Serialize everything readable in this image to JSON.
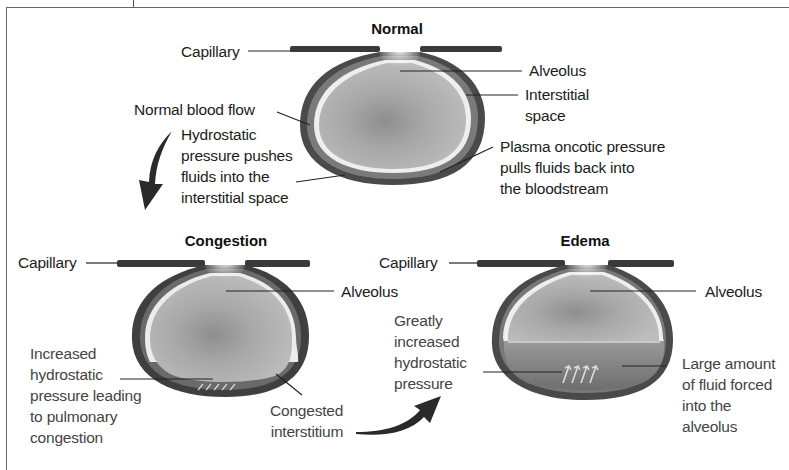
{
  "panels": {
    "normal": {
      "title": "Normal",
      "labels": {
        "capillary": "Capillary",
        "alveolus": "Alveolus",
        "interstitial": [
          "Interstitial",
          "space"
        ],
        "blood_flow": "Normal blood flow",
        "hydrostatic": [
          "Hydrostatic",
          "pressure pushes",
          "fluids into the",
          "interstitial space"
        ],
        "oncotic": [
          "Plasma oncotic pressure",
          "pulls fluids back into",
          "the bloodstream"
        ]
      }
    },
    "congestion": {
      "title": "Congestion",
      "labels": {
        "capillary": "Capillary",
        "alveolus": "Alveolus",
        "increased": [
          "Increased",
          "hydrostatic",
          "pressure leading",
          "to pulmonary",
          "congestion"
        ],
        "congested": [
          "Congested",
          "interstitium"
        ]
      }
    },
    "edema": {
      "title": "Edema",
      "labels": {
        "capillary": "Capillary",
        "alveolus": "Alveolus",
        "greatly": [
          "Greatly",
          "increased",
          "hydrostatic",
          "pressure"
        ],
        "fluid": [
          "Large amount",
          "of fluid forced",
          "into the",
          "alveolus"
        ]
      }
    }
  },
  "colors": {
    "wall": "#3a3a3a",
    "interstitium": "#6b6b6b",
    "alveolus_fill": "#a9a9a9",
    "fluid": "#8a8a8a",
    "membrane": "#f2f2f2"
  }
}
